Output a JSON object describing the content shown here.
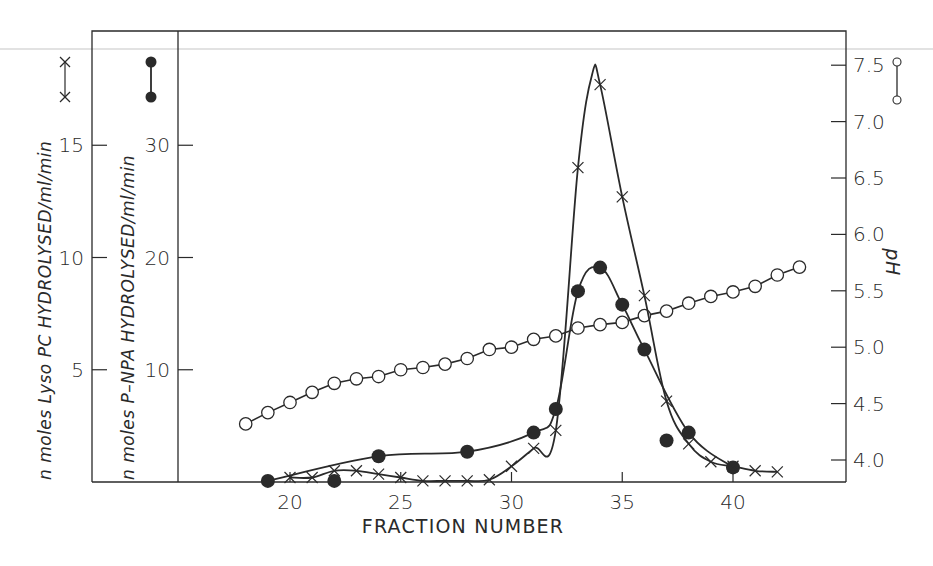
{
  "chart_data": {
    "type": "line",
    "title": "",
    "xlabel": "FRACTION NUMBER",
    "x_ticks": [
      20,
      25,
      30,
      35,
      40
    ],
    "xlim": [
      15.9,
      44.9
    ],
    "grid": false,
    "legend_position": "beside each y-axis label (symbol key)",
    "axes": {
      "left_outer": {
        "label": "n moles Lyso PC  HYDROLYSED/ml/min",
        "symbol_key": "x—x",
        "ticks": [
          5,
          10,
          15
        ],
        "ylim": [
          0,
          20.2
        ]
      },
      "left_inner": {
        "label": "n moles P–NPA  HYDROLYSED/ml/min",
        "symbol_key": "●—●",
        "ticks": [
          10,
          20,
          30
        ],
        "ylim": [
          0,
          40.3
        ]
      },
      "right": {
        "label": "pH",
        "symbol_key": "○—○",
        "ticks": [
          "4.0",
          "4.5",
          "5.0",
          "5.5",
          "6.0",
          "6.5",
          "7.0",
          "7.5"
        ],
        "ylim": [
          3.8,
          7.6
        ]
      }
    },
    "series": [
      {
        "name": "Lyso PC hydrolysed (nmoles/ml/min)",
        "marker": "cross",
        "axis": "left_outer",
        "x": [
          20,
          21,
          22,
          23,
          24,
          25,
          26,
          27,
          28,
          29,
          30,
          31,
          32,
          33,
          34,
          35,
          36,
          37,
          38,
          39,
          40,
          41,
          42
        ],
        "values": [
          0.2,
          0.2,
          0.5,
          0.5,
          0.35,
          0.2,
          0.05,
          0.05,
          0.05,
          0.1,
          0.7,
          1.5,
          2.3,
          14.0,
          17.7,
          12.7,
          8.3,
          3.6,
          1.7,
          0.9,
          0.7,
          0.5,
          0.45
        ]
      },
      {
        "name": "P-NPA hydrolysed (nmoles/ml/min)",
        "marker": "filled-circle",
        "axis": "left_inner",
        "x": [
          19,
          22,
          24,
          28,
          31,
          32,
          33,
          34,
          35,
          36,
          37,
          38,
          40
        ],
        "values": [
          0.1,
          0.1,
          2.3,
          2.7,
          4.4,
          6.5,
          17.0,
          19.1,
          15.8,
          11.8,
          3.7,
          4.4,
          1.3
        ]
      },
      {
        "name": "pH",
        "marker": "open-circle",
        "axis": "right",
        "x": [
          18,
          19,
          20,
          21,
          22,
          23,
          24,
          25,
          26,
          27,
          28,
          29,
          30,
          31,
          32,
          33,
          34,
          35,
          36,
          37,
          38,
          39,
          40,
          41,
          42,
          43
        ],
        "values": [
          4.32,
          4.42,
          4.51,
          4.6,
          4.68,
          4.72,
          4.74,
          4.8,
          4.82,
          4.85,
          4.9,
          4.98,
          5.0,
          5.07,
          5.1,
          5.17,
          5.2,
          5.22,
          5.28,
          5.32,
          5.39,
          5.45,
          5.49,
          5.54,
          5.64,
          5.71
        ]
      }
    ]
  },
  "labels": {
    "xlabel": "FRACTION NUMBER",
    "ylabel_outer": "n moles Lyso PC  HYDROLYSED/ml/min",
    "ylabel_inner": "n moles P–NPA  HYDROLYSED/ml/min",
    "ylabel_right": "pH"
  },
  "colors": {
    "ink": "#2a2a2a",
    "background": "#ffffff",
    "top_rule": "#d8d8d8"
  }
}
